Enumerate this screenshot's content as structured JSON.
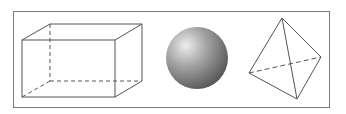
{
  "figure": {
    "shapes": [
      {
        "name": "rectangular-prism",
        "label": ""
      },
      {
        "name": "sphere",
        "label": ""
      },
      {
        "name": "tetrahedron",
        "label": ""
      }
    ],
    "colors": {
      "line": "#555555",
      "frame": "#777777",
      "sphere_light": "#e6e6e6",
      "sphere_mid": "#9a9a9a",
      "sphere_dark": "#5a5a5a"
    }
  }
}
